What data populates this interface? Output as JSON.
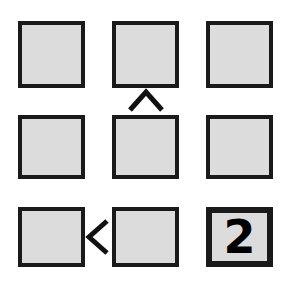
{
  "canvas": {
    "width": 295,
    "height": 284,
    "background_color": "#ffffff"
  },
  "style": {
    "tile_fill_color": "#dcdcdc",
    "tile_border_color": "#1a1a1a",
    "glyph_color": "#000000",
    "arrow_color": "#111111"
  },
  "grid": {
    "rows": 3,
    "columns": 3,
    "cells": [
      {
        "id": "r1c1",
        "row": 1,
        "col": 1,
        "value": "",
        "emphasis": false
      },
      {
        "id": "r1c2",
        "row": 1,
        "col": 2,
        "value": "",
        "emphasis": false
      },
      {
        "id": "r1c3",
        "row": 1,
        "col": 3,
        "value": "",
        "emphasis": false
      },
      {
        "id": "r2c1",
        "row": 2,
        "col": 1,
        "value": "",
        "emphasis": false
      },
      {
        "id": "r2c2",
        "row": 2,
        "col": 2,
        "value": "",
        "emphasis": false
      },
      {
        "id": "r2c3",
        "row": 2,
        "col": 3,
        "value": "",
        "emphasis": false
      },
      {
        "id": "r3c1",
        "row": 3,
        "col": 1,
        "value": "",
        "emphasis": false
      },
      {
        "id": "r3c2",
        "row": 3,
        "col": 2,
        "value": "",
        "emphasis": false
      },
      {
        "id": "r3c3",
        "row": 3,
        "col": 3,
        "value": "2",
        "emphasis": true
      }
    ]
  },
  "arrows": [
    {
      "id": "arrow-up",
      "icon": "chevron-up-icon",
      "direction": "up",
      "between": "r2c2-to-r1c2"
    },
    {
      "id": "arrow-left",
      "icon": "chevron-left-icon",
      "direction": "left",
      "between": "r3c2-to-r3c1"
    }
  ]
}
